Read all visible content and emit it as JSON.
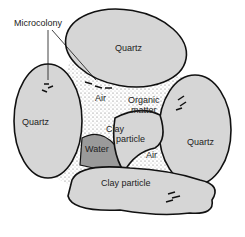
{
  "diagram": {
    "labels": {
      "microcolony": "Microcolony",
      "quartz_top": "Quartz",
      "quartz_left": "Quartz",
      "quartz_right": "Quartz",
      "air_1": "Air",
      "organic_1": "Organic",
      "organic_2": "matter",
      "clay_1": "Clay",
      "clay_2": "particle",
      "water": "Water",
      "air_2": "Air",
      "clay_bottom": "Clay particle"
    },
    "colors": {
      "grain": "#d6d6d6",
      "water": "#9a9a9a",
      "outline": "#111111"
    }
  }
}
